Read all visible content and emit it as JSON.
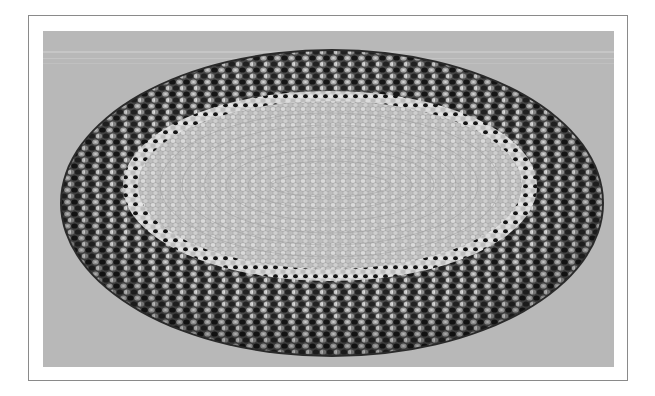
{
  "figure": {
    "frame_color": "#8a8a8a",
    "background_color": "#ffffff",
    "photo_background_color": "#b9b9b9",
    "rug": {
      "outer_border_colors": [
        "#1a1a1a",
        "#3c3c3c",
        "#6e6e6e",
        "#9a9a9a",
        "#c4c4c4"
      ],
      "inner_field_colors": [
        "#a8a8a8",
        "#bdbdbd",
        "#d0d0d0",
        "#e0e0e0"
      ],
      "transition_band_color": "#d8d8d8"
    }
  }
}
